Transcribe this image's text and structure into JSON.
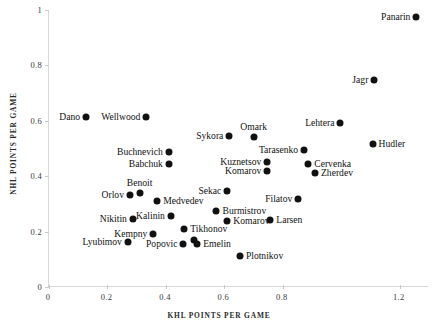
{
  "chart_data": {
    "type": "scatter",
    "title": "",
    "xlabel": "KHL POINTS PER GAME",
    "ylabel": "NHL POINTS PER GAME",
    "xlim": [
      0,
      1.3
    ],
    "ylim": [
      0,
      1.0
    ],
    "grid": false,
    "legend": null,
    "xticks": [
      "0",
      "0.2",
      "0.4",
      "0.6",
      "0.8",
      "1.2"
    ],
    "xtick_values": [
      0,
      0.2,
      0.4,
      0.6,
      0.8,
      1.2
    ],
    "yticks": [
      "0",
      "0.2",
      "0.4",
      "0.6",
      "0.8",
      "1"
    ],
    "ytick_values": [
      0,
      0.2,
      0.4,
      0.6,
      0.8,
      1.0
    ],
    "points": [
      {
        "label": "Panarin",
        "x": 1.257,
        "y": 0.975,
        "label_pos": "left"
      },
      {
        "label": "Jagr",
        "x": 1.113,
        "y": 0.748,
        "label_pos": "left"
      },
      {
        "label": "Dano",
        "x": 0.127,
        "y": 0.614,
        "label_pos": "left"
      },
      {
        "label": "Wellwood",
        "x": 0.333,
        "y": 0.614,
        "label_pos": "left"
      },
      {
        "label": "Lehtera",
        "x": 0.997,
        "y": 0.592,
        "label_pos": "left"
      },
      {
        "label": "Sykora",
        "x": 0.617,
        "y": 0.545,
        "label_pos": "left"
      },
      {
        "label": "Omark",
        "x": 0.7,
        "y": 0.541,
        "label_pos": "above"
      },
      {
        "label": "Hudler",
        "x": 1.107,
        "y": 0.516,
        "label_pos": "right"
      },
      {
        "label": "Buchnevich",
        "x": 0.41,
        "y": 0.487,
        "label_pos": "left"
      },
      {
        "label": "Tarasenko",
        "x": 0.873,
        "y": 0.494,
        "label_pos": "left"
      },
      {
        "label": "Kuznetsov",
        "x": 0.747,
        "y": 0.451,
        "label_pos": "left"
      },
      {
        "label": "Babchuk",
        "x": 0.41,
        "y": 0.444,
        "label_pos": "left"
      },
      {
        "label": "Cervenka",
        "x": 0.887,
        "y": 0.444,
        "label_pos": "right"
      },
      {
        "label": "Komarov",
        "x": 0.747,
        "y": 0.419,
        "label_pos": "left"
      },
      {
        "label": "Zherdev",
        "x": 0.91,
        "y": 0.411,
        "label_pos": "right"
      },
      {
        "label": "Benoit",
        "x": 0.31,
        "y": 0.339,
        "label_pos": "above"
      },
      {
        "label": "Orlov",
        "x": 0.277,
        "y": 0.332,
        "label_pos": "left"
      },
      {
        "label": "Sekac",
        "x": 0.61,
        "y": 0.346,
        "label_pos": "left"
      },
      {
        "label": "Filatov",
        "x": 0.853,
        "y": 0.317,
        "label_pos": "left"
      },
      {
        "label": "Medvedev",
        "x": 0.37,
        "y": 0.31,
        "label_pos": "right"
      },
      {
        "label": "Burmistrov",
        "x": 0.573,
        "y": 0.274,
        "label_pos": "right"
      },
      {
        "label": "Nikitin",
        "x": 0.287,
        "y": 0.245,
        "label_pos": "left"
      },
      {
        "label": "Komarov",
        "x": 0.61,
        "y": 0.238,
        "label_pos": "right"
      },
      {
        "label": "Larsen",
        "x": 0.757,
        "y": 0.241,
        "label_pos": "right"
      },
      {
        "label": "Kalinin",
        "x": 0.417,
        "y": 0.256,
        "label_pos": "left"
      },
      {
        "label": "Tikhonov",
        "x": 0.463,
        "y": 0.209,
        "label_pos": "right"
      },
      {
        "label": "Kempny",
        "x": 0.357,
        "y": 0.191,
        "label_pos": "left"
      },
      {
        "label": "Lyubimov",
        "x": 0.27,
        "y": 0.162,
        "label_pos": "left"
      },
      {
        "label": "Popovic",
        "x": 0.46,
        "y": 0.155,
        "label_pos": "left"
      },
      {
        "label": "Emelin",
        "x": 0.507,
        "y": 0.155,
        "label_pos": "right"
      },
      {
        "label": "",
        "x": 0.497,
        "y": 0.169,
        "label_pos": "none"
      },
      {
        "label": "Plotnikov",
        "x": 0.653,
        "y": 0.112,
        "label_pos": "right"
      }
    ]
  }
}
